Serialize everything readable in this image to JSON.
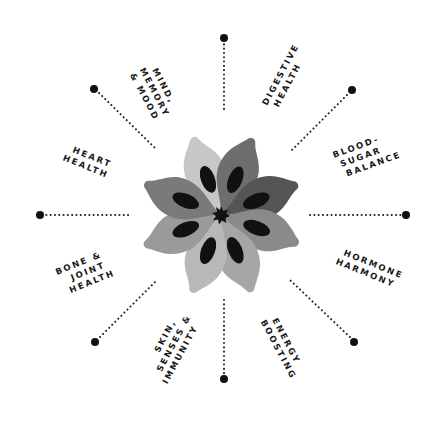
{
  "center": {
    "x": 221,
    "y": 215
  },
  "colors": {
    "ink": "#111111",
    "dot": "#111111",
    "petal_dark": "#555555",
    "petal_mid": "#7a7a7a",
    "petal_light": "#a5a5a5",
    "petal_lightest": "#c4c4c4",
    "seed": "#111111"
  },
  "spokes": [
    {
      "id": "top",
      "angle": -90,
      "lines": [
        "",
        ""
      ]
    },
    {
      "id": "digestive",
      "angle": -45,
      "lines": [
        "DIGESTIVE",
        "HEALTH"
      ]
    },
    {
      "id": "right",
      "angle": 0,
      "lines": [
        "BLOOD-",
        "SUGAR",
        "BALANCE"
      ]
    },
    {
      "id": "hormone",
      "angle": 45,
      "lines": [
        "HORMONE",
        "HARMONY"
      ]
    }
  ],
  "labels": {
    "mind": [
      "MIND,",
      "MEMORY",
      "& MOOD"
    ],
    "digestive": [
      "DIGESTIVE",
      "HEALTH"
    ],
    "blood_sugar": [
      "BLOOD-",
      "SUGAR",
      "BALANCE"
    ],
    "hormone": [
      "HORMONE",
      "HARMONY"
    ],
    "energy": [
      "ENERGY",
      "BOOSTING"
    ],
    "skin": [
      "SKIN,",
      "SENSES &",
      "IMMUNITY"
    ],
    "bone": [
      "BONE &",
      "JOINT",
      "HEALTH"
    ],
    "heart": [
      "HEART",
      "HEALTH"
    ]
  }
}
